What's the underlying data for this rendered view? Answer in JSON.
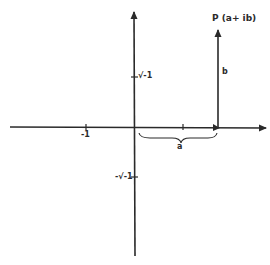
{
  "diagram": {
    "type": "argand-plane",
    "stroke_color": "#2a2a2a",
    "background": "#ffffff",
    "point_label": "P (a+ ib)",
    "vertical_component_label": "b",
    "horizontal_component_label": "a",
    "x_axis_ticks": [
      {
        "label": "-1",
        "value": -1
      },
      {
        "label": "1",
        "value": 1
      }
    ],
    "y_axis_ticks": [
      {
        "label": "√-1",
        "value": 1
      },
      {
        "label": "-√-1",
        "value": -1
      }
    ]
  }
}
